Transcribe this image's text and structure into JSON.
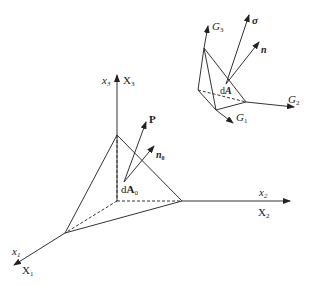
{
  "figure": {
    "type": "tetrahedron-stress-diagram",
    "reference_config": {
      "axis_x3": {
        "lower": "x",
        "lower_sub": "3",
        "upper": "X",
        "upper_sub": "3"
      },
      "axis_x2": {
        "lower": "x",
        "lower_sub": "2",
        "upper": "X",
        "upper_sub": "2"
      },
      "axis_x1": {
        "lower": "x",
        "lower_sub": "1",
        "upper": "X",
        "upper_sub": "1"
      },
      "vector_P": "P",
      "vector_n0": {
        "base": "n",
        "sub": "0"
      },
      "area": {
        "prefix": "d",
        "base": "A",
        "sub": "0"
      }
    },
    "current_config": {
      "axis_G3": {
        "base": "G",
        "sub": "3"
      },
      "axis_G2": {
        "base": "G",
        "sub": "2"
      },
      "axis_G1": {
        "base": "G",
        "sub": "1"
      },
      "vector_sigma": "σ",
      "vector_n": "n",
      "area": {
        "prefix": "d",
        "base": "A"
      }
    },
    "colors": {
      "line": "#333333",
      "background": "#ffffff"
    }
  }
}
